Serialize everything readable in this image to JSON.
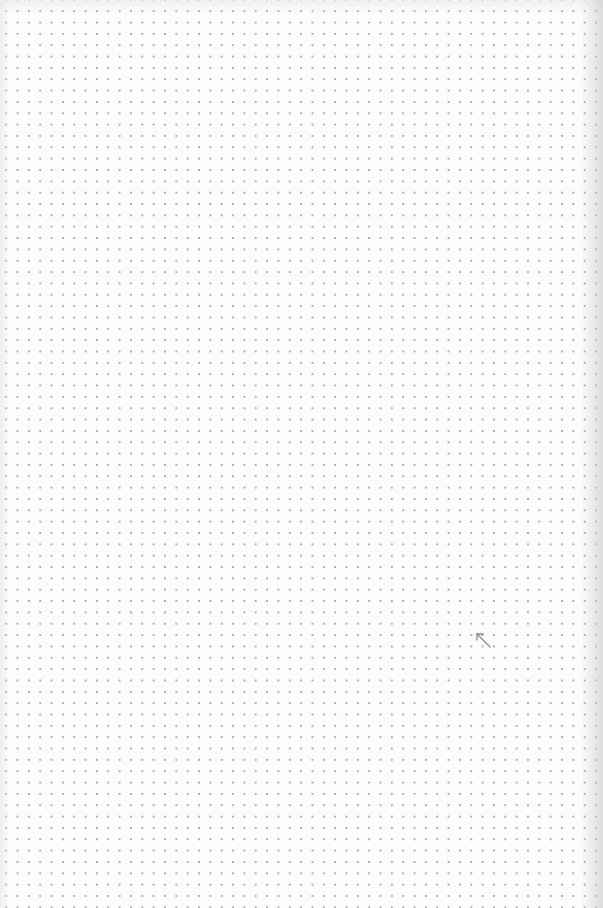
{
  "scene": {
    "description": "Dot-grid paper sheet with a small hand-drawn arrow",
    "paper_color": "#fcfcfc",
    "dot_color": "#a9a9a9",
    "dot_spacing_px": 11.35
  },
  "marks": [
    {
      "type": "arrow",
      "direction": "up-left",
      "color": "#8a8a8a",
      "position": {
        "x": 476,
        "y": 634
      }
    }
  ]
}
